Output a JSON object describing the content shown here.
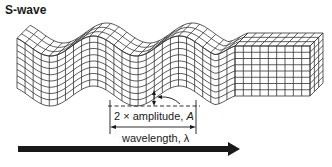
{
  "diagram": {
    "title": "S-wave",
    "labels": {
      "amplitude_prefix": "2 × amplitude, ",
      "amplitude_symbol": "A",
      "wavelength": "wavelength, λ"
    },
    "elements": {
      "wave_mesh": "Wavy deformed grid block (shear wave)",
      "undisturbed_block": "Undeformed grid block on right",
      "amplitude_marker": "Vertical double arrow indicating 2× amplitude",
      "wavelength_marker": "Horizontal double arrow indicating wavelength",
      "propagation_arrow": "Thick arrow indicating direction of wave propagation"
    },
    "colors": {
      "ink": "#1a1a1a",
      "grid": "#333333",
      "background": "#ffffff"
    }
  }
}
